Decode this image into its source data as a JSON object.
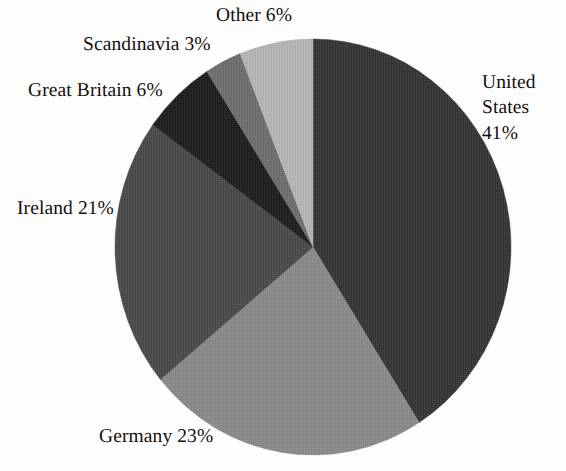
{
  "figure": {
    "background_color": "#fdfdfd",
    "text_color": "#14100e"
  },
  "chart_data": {
    "type": "pie",
    "title": "",
    "xlabel": "",
    "ylabel": "",
    "legend_position": "none",
    "labels_position": "outside",
    "grid": false,
    "start_angle_deg": 0,
    "direction": "clockwise",
    "total_percent": 100,
    "categories": [
      "United States",
      "Germany",
      "Ireland",
      "Great Britain",
      "Scandinavia",
      "Other"
    ],
    "values": [
      41,
      23,
      21,
      6,
      3,
      6
    ],
    "colors": [
      "#353535",
      "#8a8a8a",
      "#4a4a4a",
      "#1e1e1e",
      "#6e6e6e",
      "#b5b5b5"
    ],
    "slices": [
      {
        "name": "United States",
        "value": 41,
        "label": "United\nStates\n41%",
        "color": "#353535"
      },
      {
        "name": "Germany",
        "value": 23,
        "label": "Germany 23%",
        "color": "#8a8a8a"
      },
      {
        "name": "Ireland",
        "value": 21,
        "label": "Ireland 21%",
        "color": "#4a4a4a"
      },
      {
        "name": "Great Britain",
        "value": 6,
        "label": "Great Britain 6%",
        "color": "#1e1e1e"
      },
      {
        "name": "Scandinavia",
        "value": 3,
        "label": "Scandinavia 3%",
        "color": "#6e6e6e"
      },
      {
        "name": "Other",
        "value": 6,
        "label": "Other 6%",
        "color": "#b5b5b5"
      }
    ]
  },
  "geometry": {
    "center_x": 313,
    "center_y": 247,
    "radius_x": 198,
    "radius_y": 208
  }
}
